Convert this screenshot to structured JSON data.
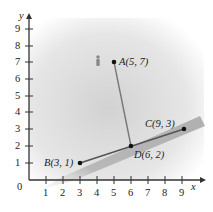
{
  "figure": {
    "axes": {
      "x_label": "x",
      "y_label": "y",
      "origin_label": "0",
      "x_ticks": [
        "1",
        "2",
        "3",
        "4",
        "5",
        "6",
        "7",
        "8",
        "9"
      ],
      "y_ticks": [
        "1",
        "2",
        "3",
        "4",
        "5",
        "6",
        "7",
        "8",
        "9"
      ]
    },
    "points": [
      {
        "name": "A",
        "label": "A(5, 7)",
        "x": 5,
        "y": 7
      },
      {
        "name": "B",
        "label": "B(3, 1)",
        "x": 3,
        "y": 1
      },
      {
        "name": "C",
        "label": "C(9, 3)",
        "x": 9,
        "y": 3
      },
      {
        "name": "D",
        "label": "D(6, 2)",
        "x": 6,
        "y": 2
      }
    ],
    "segments": [
      {
        "from": "B",
        "to": "C",
        "description": "line through B, D, C on shaded path"
      },
      {
        "from": "A",
        "to": "D",
        "description": "perpendicular from A to line BC"
      }
    ],
    "colors": {
      "background_shade": "#d9d9d9",
      "path_band": "#b5b5b5",
      "line": "#555555",
      "point": "#111111",
      "axis": "#333333"
    }
  }
}
